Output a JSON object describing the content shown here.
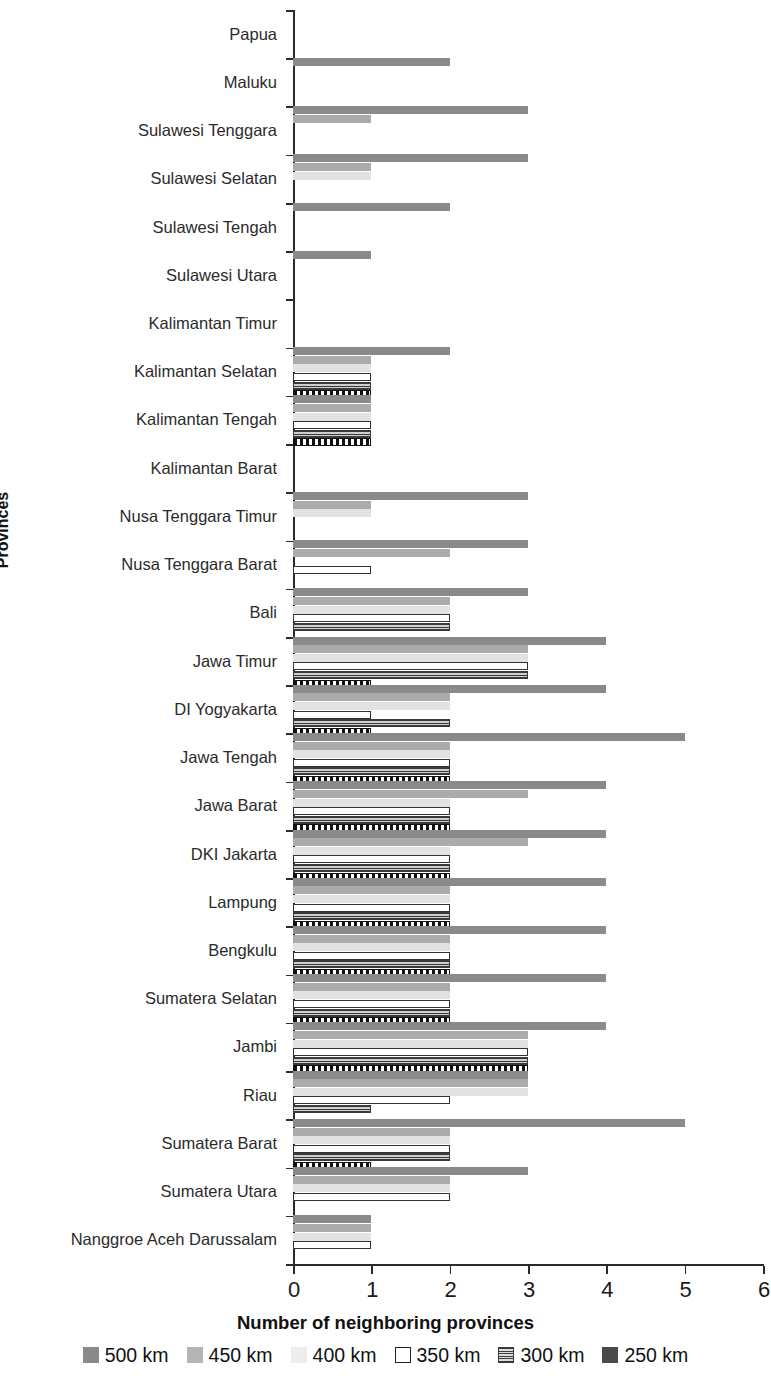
{
  "chart_data": {
    "type": "bar",
    "orientation": "horizontal",
    "title": "",
    "xlabel": "Number of neighboring provinces",
    "ylabel": "Provinces",
    "xlim": [
      0,
      6
    ],
    "xticks": [
      "0",
      "1",
      "2",
      "3",
      "4",
      "5",
      "6"
    ],
    "grid": false,
    "legend_position": "bottom",
    "categories": [
      "Papua",
      "Maluku",
      "Sulawesi Tenggara",
      "Sulawesi Selatan",
      "Sulawesi Tengah",
      "Sulawesi Utara",
      "Kalimantan Timur",
      "Kalimantan Selatan",
      "Kalimantan Tengah",
      "Kalimantan Barat",
      "Nusa Tenggara Timur",
      "Nusa Tenggara Barat",
      "Bali",
      "Jawa Timur",
      "DI Yogyakarta",
      "Jawa Tengah",
      "Jawa Barat",
      "DKI  Jakarta",
      "Lampung",
      "Bengkulu",
      "Sumatera Selatan",
      "Jambi",
      "Riau",
      "Sumatera Barat",
      "Sumatera Utara",
      "Nanggroe Aceh Darussalam"
    ],
    "series": [
      {
        "name": "500 km",
        "color": "#8a8a8a",
        "values": [
          0,
          2,
          3,
          3,
          2,
          1,
          0,
          2,
          1,
          0,
          3,
          3,
          3,
          4,
          4,
          5,
          4,
          4,
          4,
          4,
          4,
          4,
          3,
          5,
          3,
          1
        ]
      },
      {
        "name": "450 km",
        "color": "#ababab",
        "values": [
          0,
          0,
          1,
          1,
          0,
          0,
          0,
          1,
          1,
          0,
          1,
          2,
          2,
          3,
          2,
          2,
          3,
          3,
          2,
          2,
          2,
          3,
          3,
          2,
          2,
          1
        ]
      },
      {
        "name": "400 km",
        "color": "#e2e2e2",
        "values": [
          0,
          0,
          0,
          1,
          0,
          0,
          0,
          1,
          1,
          0,
          1,
          0,
          2,
          3,
          2,
          2,
          2,
          2,
          2,
          2,
          2,
          3,
          3,
          2,
          2,
          1
        ]
      },
      {
        "name": "350 km",
        "color": "#ffffff",
        "values": [
          0,
          0,
          0,
          0,
          0,
          0,
          0,
          1,
          1,
          0,
          0,
          1,
          2,
          3,
          1,
          2,
          2,
          2,
          2,
          2,
          2,
          3,
          2,
          2,
          2,
          1
        ]
      },
      {
        "name": "300 km",
        "color": "#3a3a3a",
        "values": [
          0,
          0,
          0,
          0,
          0,
          0,
          0,
          1,
          1,
          0,
          0,
          0,
          2,
          3,
          2,
          2,
          2,
          2,
          2,
          2,
          2,
          3,
          1,
          2,
          0,
          0
        ]
      },
      {
        "name": "250 km",
        "color": "#111111",
        "values": [
          0,
          0,
          0,
          0,
          0,
          0,
          0,
          1,
          1,
          0,
          0,
          0,
          0,
          1,
          1,
          2,
          2,
          2,
          2,
          2,
          2,
          3,
          0,
          1,
          0,
          0
        ]
      }
    ]
  }
}
